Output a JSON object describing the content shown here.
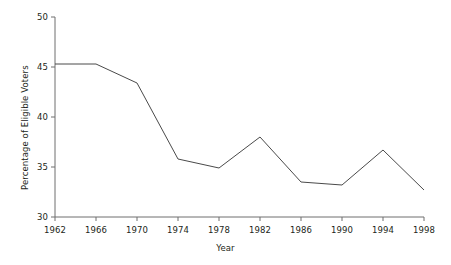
{
  "chart_data": {
    "type": "line",
    "title": "",
    "xlabel": "Year",
    "ylabel": "Percentage of Eligible Voters",
    "x": [
      1962,
      1966,
      1970,
      1974,
      1978,
      1982,
      1986,
      1990,
      1994,
      1998
    ],
    "values": [
      45.3,
      45.3,
      43.4,
      35.8,
      34.9,
      38.0,
      33.5,
      33.2,
      36.7,
      32.7
    ],
    "xtick_labels": [
      "1962",
      "1966",
      "1970",
      "1974",
      "1978",
      "1982",
      "1986",
      "1990",
      "1994",
      "1998"
    ],
    "ytick_labels": [
      "30",
      "35",
      "40",
      "45",
      "50"
    ],
    "yticks": [
      30,
      35,
      40,
      45,
      50
    ],
    "xlim": [
      1962,
      1998
    ],
    "ylim": [
      30,
      50
    ],
    "grid": false,
    "legend": false,
    "series": [
      {
        "name": "Percentage of Eligible Voters",
        "values": [
          45.3,
          45.3,
          43.4,
          35.8,
          34.9,
          38.0,
          33.5,
          33.2,
          36.7,
          32.7
        ],
        "color": "#4a4a4a"
      }
    ],
    "colors": {
      "line": "#4a4a4a",
      "axis": "#6f6f6f",
      "text": "#231f20",
      "background": "#ffffff"
    }
  }
}
